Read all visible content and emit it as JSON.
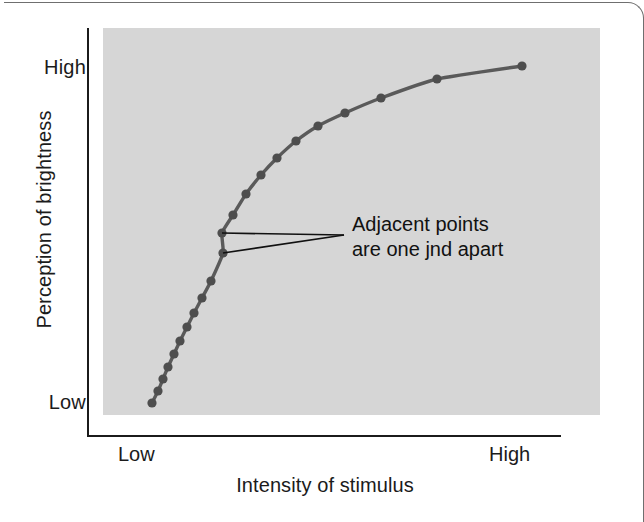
{
  "figure": {
    "background_color": "#ffffff",
    "plot_background_color": "#d6d6d6",
    "axis_color": "#1b1b1b",
    "curve_color": "#5a5a5a",
    "point_color": "#4e4e4e",
    "text_color": "#1b1b1b"
  },
  "chart_data": {
    "type": "line",
    "title": "",
    "subtitle": "",
    "xlabel": "Intensity of stimulus",
    "ylabel": "Perception of brightness",
    "xtick_labels": [
      "Low",
      "High"
    ],
    "ytick_labels": [
      "Low",
      "High"
    ],
    "xlim": [
      0,
      1
    ],
    "ylim": [
      0,
      1
    ],
    "grid": false,
    "legend": null,
    "series": [
      {
        "name": "Perceived brightness vs stimulus intensity",
        "marker": "circle",
        "points_px": [
          [
            152,
            403
          ],
          [
            158,
            391
          ],
          [
            163,
            379
          ],
          [
            168,
            367
          ],
          [
            174,
            354
          ],
          [
            180,
            341
          ],
          [
            187,
            327
          ],
          [
            194,
            313
          ],
          [
            202,
            298
          ],
          [
            211,
            281
          ],
          [
            223,
            253
          ],
          [
            222,
            233
          ],
          [
            233,
            215
          ],
          [
            246,
            194
          ],
          [
            261,
            175
          ],
          [
            277,
            158
          ],
          [
            296,
            141
          ],
          [
            318,
            126
          ],
          [
            345,
            113
          ],
          [
            381,
            98
          ],
          [
            437,
            79
          ],
          [
            522,
            66
          ]
        ],
        "n_points": 22
      }
    ],
    "annotations": [
      {
        "id": "jnd-note",
        "lines": [
          "Adjacent points",
          "are one jnd apart"
        ],
        "text_x": 352,
        "text_y": 212,
        "leader_apex": [
          344,
          235
        ],
        "leader_targets": [
          [
            222,
            233
          ],
          [
            223,
            253
          ]
        ]
      }
    ]
  },
  "axes": {
    "y": {
      "title": "Perception of brightness",
      "high_label": "High",
      "low_label": "Low"
    },
    "x": {
      "title": "Intensity of stimulus",
      "high_label": "High",
      "low_label": "Low"
    }
  },
  "annotation": {
    "line1": "Adjacent points",
    "line2": "are one jnd apart"
  }
}
